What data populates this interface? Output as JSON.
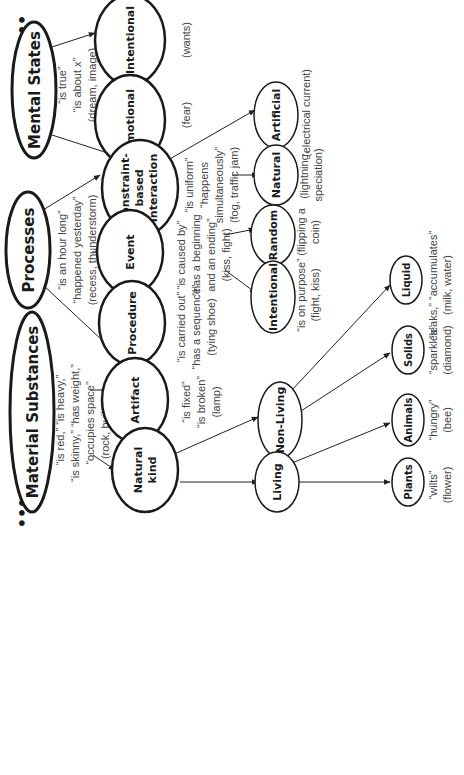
{
  "diagram": {
    "ellipsis": "•••",
    "roots": {
      "material": {
        "label": "Material Substances",
        "notes": [
          "“is red,” “is heavy,”",
          "“is skinny,” “has weight,”",
          "“occupies space”",
          "(rock, building)"
        ]
      },
      "processes": {
        "label": "Processes",
        "notes": [
          "“is an hour long”",
          "“happened yesterday”",
          "(recess, thunderstorm)"
        ]
      },
      "mental": {
        "label": "Mental States",
        "notes": [
          "“is true”",
          "“is about x”",
          "(dream, image)"
        ]
      }
    },
    "nodes": {
      "natural_kind": {
        "label_lines": [
          "Natural",
          "kind"
        ]
      },
      "artifact": {
        "label": "Artifact",
        "notes": [
          "“is fixed”",
          "“is broken”",
          "(lamp)"
        ]
      },
      "procedure": {
        "label": "Procedure",
        "notes": [
          "“is carried out”",
          "“has a sequence”",
          "(tying shoe)"
        ]
      },
      "event": {
        "label": "Event",
        "notes": [
          "“is caused by”",
          "“has a beginning",
          "and an ending”",
          "(kiss, fight)"
        ]
      },
      "constraint": {
        "label_lines": [
          "Constraint-",
          "based",
          "Interaction"
        ],
        "notes": [
          "“is uniform”",
          "“happens",
          "simultaneously”",
          "(fog, traffic jam)"
        ]
      },
      "emotional": {
        "label": "Emotional",
        "notes": [
          "(fear)"
        ]
      },
      "intentional_mental": {
        "label": "Intentional",
        "notes": [
          "(wants)"
        ]
      },
      "living": {
        "label": "Living"
      },
      "non_living": {
        "label": "Non-Living"
      },
      "intentional_event": {
        "label": "Intentional",
        "notes": [
          "“is on purpose”",
          "(fight, kiss)"
        ]
      },
      "random": {
        "label": "Random",
        "notes": [
          "(flipping a",
          "coin)"
        ]
      },
      "natural_cbi": {
        "label": "Natural",
        "notes": [
          "(lightning,",
          "speciation)"
        ]
      },
      "artificial": {
        "label": "Artificial",
        "notes": [
          "(electrical current)"
        ]
      },
      "plants": {
        "label": "Plants",
        "notes": [
          "“wilts”",
          "(flower)"
        ]
      },
      "animals": {
        "label": "Animals",
        "notes": [
          "“hungry”",
          "(bee)"
        ]
      },
      "solids": {
        "label": "Solids",
        "notes": [
          "“sparkles”",
          "(diamond)"
        ]
      },
      "liquid": {
        "label": "Liquid",
        "notes": [
          "“leaks,” “accumulates”",
          "(milk, water)"
        ]
      }
    }
  }
}
